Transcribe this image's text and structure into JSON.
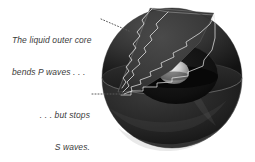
{
  "figure": {
    "background_color": "#ffffff",
    "width": 255,
    "height": 162
  },
  "annotations": [
    {
      "id": "p-wave-caption",
      "line1": "The liquid outer core",
      "line2": "bends P waves . . .",
      "text_color": "#3b3b3b",
      "leader": "dotted",
      "leader_from": [
        104,
        20
      ],
      "leader_to": [
        127,
        30
      ]
    },
    {
      "id": "s-wave-caption",
      "line1": ". . . but stops",
      "line2": "S waves.",
      "text_color": "#3b3b3b",
      "leader": "dotted",
      "leader_from": [
        92,
        94
      ],
      "leader_to": [
        122,
        94
      ]
    }
  ],
  "diagram": {
    "sphere": {
      "label": "earth-globe",
      "center": [
        172,
        78
      ],
      "radius": 70,
      "surface_color": "#2a2a2a",
      "lower_hemisphere_color": "#232323"
    },
    "cut_plane": {
      "label": "equatorial-cut-plane",
      "color": "#4a4a4a"
    },
    "outer_core": {
      "label": "liquid-outer-core",
      "color": "#151515"
    },
    "inner_core": {
      "label": "solid-inner-core",
      "color": "#d8d8d8"
    },
    "wedge": {
      "label": "mantle-cutaway-wedge",
      "color": "#3c3c3c"
    },
    "wave_paths": {
      "label": "p-wave-ray-paths",
      "count": 4,
      "style": "wavy",
      "color": "#e8e8e8"
    }
  }
}
